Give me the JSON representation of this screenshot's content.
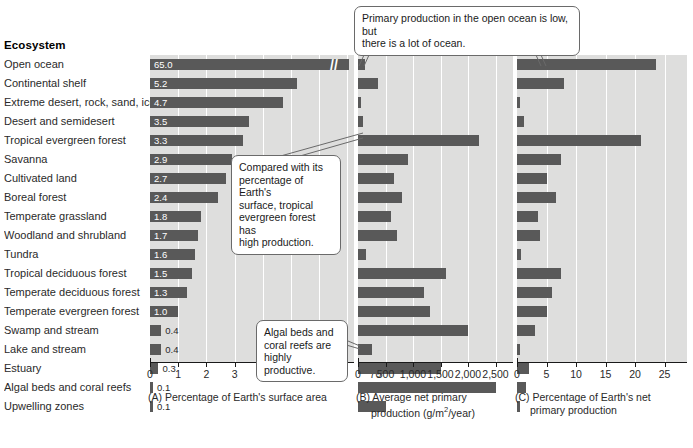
{
  "figure": {
    "column_header": "Ecosystem",
    "ecosystems": [
      "Open ocean",
      "Continental shelf",
      "Extreme desert, rock, sand, ice",
      "Desert and semidesert",
      "Tropical evergreen forest",
      "Savanna",
      "Cultivated land",
      "Boreal forest",
      "Temperate grassland",
      "Woodland and shrubland",
      "Tundra",
      "Tropical deciduous forest",
      "Temperate deciduous forest",
      "Temperate evergreen forest",
      "Swamp and stream",
      "Lake and stream",
      "Estuary",
      "Algal beds and coral reefs",
      "Upwelling zones"
    ]
  },
  "chart_data": [
    {
      "type": "bar",
      "panel": "A",
      "title": "Percentage of Earth's surface area",
      "caption_prefix": "(A)",
      "orientation": "horizontal",
      "xlabel": "",
      "ylabel": "Ecosystem",
      "grid": true,
      "axis_break": true,
      "axis_break_symbol": "//",
      "tick_labels": [
        "0",
        "1",
        "2",
        "3",
        "4",
        "5",
        "6",
        "70"
      ],
      "xlim": [
        0,
        7
      ],
      "value_labels_shown": true,
      "categories": [
        "Open ocean",
        "Continental shelf",
        "Extreme desert, rock, sand, ice",
        "Desert and semidesert",
        "Tropical evergreen forest",
        "Savanna",
        "Cultivated land",
        "Boreal forest",
        "Temperate grassland",
        "Woodland and shrubland",
        "Tundra",
        "Tropical deciduous forest",
        "Temperate deciduous forest",
        "Temperate evergreen forest",
        "Swamp and stream",
        "Lake and stream",
        "Estuary",
        "Algal beds and coral reefs",
        "Upwelling zones"
      ],
      "values": [
        65.0,
        5.2,
        4.7,
        3.5,
        3.3,
        2.9,
        2.7,
        2.4,
        1.8,
        1.7,
        1.6,
        1.5,
        1.3,
        1.0,
        0.4,
        0.4,
        0.3,
        0.1,
        0.1
      ],
      "value_label_text": [
        "65.0",
        "5.2",
        "4.7",
        "3.5",
        "3.3",
        "2.9",
        "2.7",
        "2.4",
        "1.8",
        "1.7",
        "1.6",
        "1.5",
        "1.3",
        "1.0",
        "0.4",
        "0.4",
        "0.3",
        "0.1",
        "0.1"
      ]
    },
    {
      "type": "bar",
      "panel": "B",
      "title": "Average net primary production (g/m2/year)",
      "caption_prefix": "(B)",
      "caption_line1": "Average net primary",
      "caption_line2_pre": "production (g/m",
      "caption_line2_sup": "2",
      "caption_line2_post": "/year)",
      "orientation": "horizontal",
      "grid": true,
      "tick_labels": [
        "0",
        "500",
        "1,000",
        "1,500",
        "2,000",
        "2,500"
      ],
      "xlim": [
        0,
        2750
      ],
      "value_labels_shown": false,
      "categories": [
        "Open ocean",
        "Continental shelf",
        "Extreme desert, rock, sand, ice",
        "Desert and semidesert",
        "Tropical evergreen forest",
        "Savanna",
        "Cultivated land",
        "Boreal forest",
        "Temperate grassland",
        "Woodland and shrubland",
        "Tundra",
        "Tropical deciduous forest",
        "Temperate deciduous forest",
        "Temperate evergreen forest",
        "Swamp and stream",
        "Lake and stream",
        "Estuary",
        "Algal beds and coral reefs",
        "Upwelling zones"
      ],
      "values": [
        125,
        360,
        3,
        90,
        2200,
        900,
        650,
        800,
        600,
        700,
        140,
        1600,
        1200,
        1300,
        2000,
        250,
        1500,
        2500,
        500
      ]
    },
    {
      "type": "bar",
      "panel": "C",
      "title": "Percentage of Earth's net primary production",
      "caption_prefix": "(C)",
      "caption_line1": "Percentage of Earth's net",
      "caption_line2": "primary production",
      "orientation": "horizontal",
      "grid": true,
      "tick_labels": [
        "0",
        "5",
        "10",
        "15",
        "20",
        "25"
      ],
      "xlim": [
        0,
        27
      ],
      "value_labels_shown": false,
      "categories": [
        "Open ocean",
        "Continental shelf",
        "Extreme desert, rock, sand, ice",
        "Desert and semidesert",
        "Tropical evergreen forest",
        "Savanna",
        "Cultivated land",
        "Boreal forest",
        "Temperate grassland",
        "Woodland and shrubland",
        "Tundra",
        "Tropical deciduous forest",
        "Temperate deciduous forest",
        "Temperate evergreen forest",
        "Swamp and stream",
        "Lake and stream",
        "Estuary",
        "Algal beds and coral reefs",
        "Upwelling zones"
      ],
      "values": [
        23.5,
        8.0,
        0.1,
        1.2,
        21.0,
        7.5,
        5.1,
        6.6,
        3.6,
        3.9,
        0.6,
        7.4,
        5.9,
        5.0,
        3.0,
        0.5,
        2.1,
        1.5,
        0.3
      ]
    }
  ],
  "callouts": [
    {
      "id": "open-ocean-callout",
      "line1": "Primary production in the open ocean is low, but",
      "line2": "there is a lot of ocean."
    },
    {
      "id": "tropical-forest-callout",
      "line1": "Compared with its",
      "line2": "percentage of Earth's",
      "line3": "surface, tropical",
      "line4": "evergreen forest has",
      "line5": "high production."
    },
    {
      "id": "algal-beds-callout",
      "line1": "Algal beds and",
      "line2": "coral reefs are",
      "line3": "highly productive."
    }
  ],
  "colors": {
    "bar": "#595959",
    "plot_background": "#dededd",
    "gridline": "#ffffff",
    "axis": "#1a1a1a",
    "callout_border": "#6a6a6a"
  }
}
